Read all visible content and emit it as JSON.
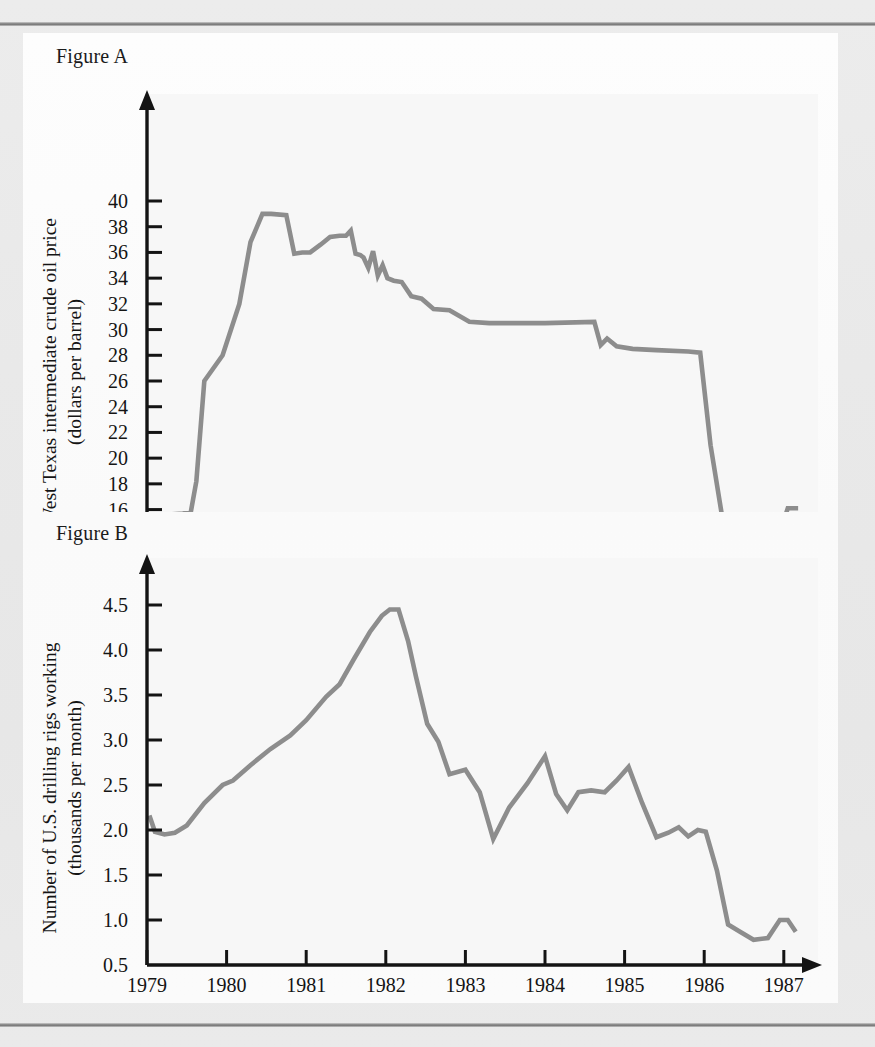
{
  "page": {
    "background_color": "#e8e8e8",
    "panel_color": "#ffffff",
    "rule_color": "#8e8e8e",
    "series_color": "#8d8d8d",
    "axis_color": "#141414"
  },
  "figures": {
    "a": {
      "label": "Figure A"
    },
    "b": {
      "label": "Figure B"
    }
  },
  "chart_data": [
    {
      "id": "figure-a",
      "type": "line",
      "title": "Figure A",
      "xlabel": "",
      "ylabel": "West Texas intermediate crude oil price (dollars per barrel)",
      "ylabel_line1": "West Texas intermediate crude oil price",
      "ylabel_line2": "(dollars per barrel)",
      "xlim": [
        1979,
        1987.25
      ],
      "ylim": [
        12,
        40
      ],
      "grid": false,
      "legend": "none",
      "xticks": [
        "1979",
        "1980",
        "1981",
        "1982",
        "1983",
        "1984",
        "1985",
        "1986",
        "1987"
      ],
      "xtick_values": [
        1979,
        1980,
        1981,
        1982,
        1983,
        1984,
        1985,
        1986,
        1987
      ],
      "yticks": [
        "12",
        "14",
        "16",
        "18",
        "20",
        "22",
        "24",
        "26",
        "28",
        "30",
        "32",
        "34",
        "36",
        "38",
        "40"
      ],
      "ytick_values": [
        12,
        14,
        16,
        18,
        20,
        22,
        24,
        26,
        28,
        30,
        32,
        34,
        36,
        38,
        40
      ],
      "series": [
        {
          "name": "West Texas intermediate crude oil price",
          "color": "#8d8d8d",
          "x": [
            1979.05,
            1979.16,
            1979.25,
            1979.45,
            1979.55,
            1979.62,
            1979.72,
            1979.95,
            1980.16,
            1980.3,
            1980.45,
            1980.52,
            1980.56,
            1980.75,
            1980.85,
            1980.95,
            1981.05,
            1981.18,
            1981.3,
            1981.42,
            1981.5,
            1981.56,
            1981.62,
            1981.68,
            1981.72,
            1981.78,
            1981.84,
            1981.9,
            1981.96,
            1982.02,
            1982.1,
            1982.2,
            1982.32,
            1982.45,
            1982.6,
            1982.8,
            1983.05,
            1983.3,
            1984.0,
            1984.62,
            1984.7,
            1984.78,
            1984.9,
            1985.1,
            1985.4,
            1985.8,
            1985.95,
            1986.08,
            1986.3,
            1986.45,
            1986.8,
            1986.95,
            1987.05,
            1987.18
          ],
          "y": [
            15.0,
            15.4,
            15.6,
            15.7,
            15.8,
            18.2,
            26.0,
            28.0,
            32.0,
            36.8,
            39.0,
            39.0,
            39.0,
            38.9,
            35.9,
            36.0,
            36.0,
            36.6,
            37.2,
            37.3,
            37.3,
            37.7,
            35.9,
            35.8,
            35.6,
            34.8,
            36.1,
            34.2,
            35.0,
            34.0,
            33.8,
            33.7,
            32.6,
            32.4,
            31.6,
            31.5,
            30.6,
            30.5,
            30.5,
            30.6,
            28.8,
            29.3,
            28.7,
            28.5,
            28.4,
            28.3,
            28.2,
            21.0,
            12.6,
            14.0,
            14.0,
            14.2,
            16.1,
            16.1
          ]
        }
      ]
    },
    {
      "id": "figure-b",
      "type": "line",
      "title": "Figure B",
      "xlabel": "",
      "ylabel": "Number of U.S. drilling rigs working (thousands per month)",
      "ylabel_line1": "Number of U.S. drilling rigs working",
      "ylabel_line2": "(thousands per month)",
      "xlim": [
        1979,
        1987.25
      ],
      "ylim": [
        0.5,
        4.75
      ],
      "grid": false,
      "legend": "none",
      "xticks": [
        "1979",
        "1980",
        "1981",
        "1982",
        "1983",
        "1984",
        "1985",
        "1986",
        "1987"
      ],
      "xtick_values": [
        1979,
        1980,
        1981,
        1982,
        1983,
        1984,
        1985,
        1986,
        1987
      ],
      "yticks": [
        "0.5",
        "1.0",
        "1.5",
        "2.0",
        "2.5",
        "3.0",
        "3.5",
        "4.0",
        "4.5"
      ],
      "ytick_values": [
        0.5,
        1.0,
        1.5,
        2.0,
        2.5,
        3.0,
        3.5,
        4.0,
        4.5
      ],
      "series": [
        {
          "name": "Number of U.S. drilling rigs working",
          "color": "#8d8d8d",
          "x": [
            1979.03,
            1979.1,
            1979.22,
            1979.35,
            1979.5,
            1979.72,
            1979.95,
            1980.08,
            1980.3,
            1980.55,
            1980.8,
            1981.0,
            1981.25,
            1981.42,
            1981.6,
            1981.8,
            1981.95,
            1982.05,
            1982.16,
            1982.28,
            1982.38,
            1982.52,
            1982.66,
            1982.8,
            1983.0,
            1983.18,
            1983.35,
            1983.55,
            1983.78,
            1984.0,
            1984.14,
            1984.28,
            1984.42,
            1984.58,
            1984.75,
            1984.9,
            1985.05,
            1985.22,
            1985.4,
            1985.55,
            1985.68,
            1985.8,
            1985.92,
            1986.02,
            1986.16,
            1986.3,
            1986.45,
            1986.62,
            1986.8,
            1986.95,
            1987.05,
            1987.15
          ],
          "y": [
            2.16,
            1.98,
            1.95,
            1.97,
            2.05,
            2.3,
            2.5,
            2.55,
            2.72,
            2.9,
            3.05,
            3.22,
            3.48,
            3.62,
            3.9,
            4.2,
            4.38,
            4.45,
            4.45,
            4.1,
            3.7,
            3.18,
            2.98,
            2.62,
            2.67,
            2.42,
            1.9,
            2.25,
            2.52,
            2.82,
            2.4,
            2.22,
            2.42,
            2.44,
            2.42,
            2.55,
            2.7,
            2.3,
            1.92,
            1.97,
            2.03,
            1.93,
            2.0,
            1.98,
            1.55,
            0.95,
            0.87,
            0.78,
            0.8,
            1.0,
            1.0,
            0.87
          ]
        }
      ]
    }
  ]
}
